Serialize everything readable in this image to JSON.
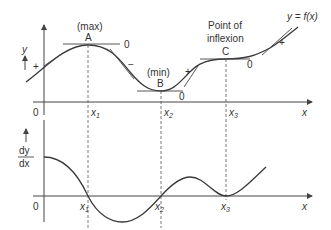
{
  "top_graph": {
    "y_axis_label": "y",
    "x_axis_label": "x",
    "origin_label": "0",
    "curve_label": "y = f(x)",
    "points": [
      {
        "id": "A",
        "caption": "(max)",
        "gradient_label": "0",
        "x_label": "x",
        "x_sub": "1"
      },
      {
        "id": "B",
        "caption": "(min)",
        "gradient_label": "0",
        "x_label": "x",
        "x_sub": "2"
      },
      {
        "id": "C",
        "caption_line1": "Point of",
        "caption_line2": "inflexion",
        "gradient_label": "0",
        "x_label": "x",
        "x_sub": "3"
      }
    ],
    "sign_labels": [
      "+",
      "−",
      "+",
      "+"
    ]
  },
  "bottom_graph": {
    "y_axis_label_num": "dy",
    "y_axis_label_den": "dx",
    "x_axis_label": "x",
    "origin_label": "0",
    "x_labels": [
      {
        "x_label": "x",
        "x_sub": "1"
      },
      {
        "x_label": "x",
        "x_sub": "2"
      },
      {
        "x_label": "x",
        "x_sub": "3"
      }
    ]
  }
}
